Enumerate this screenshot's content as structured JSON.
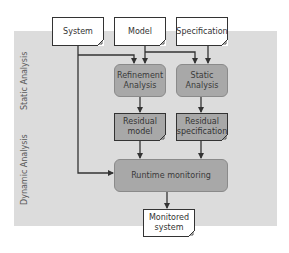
{
  "diagram": {
    "lanes": [
      {
        "label": "Static Analysis"
      },
      {
        "label": "Dynamic Analysis"
      }
    ],
    "inputs": {
      "system": "System",
      "model": "Model",
      "specification": "Specification"
    },
    "processes": {
      "refinement": {
        "line1": "Refinement",
        "line2": "Analysis"
      },
      "static": {
        "line1": "Static",
        "line2": "Analysis"
      },
      "runtime": "Runtime monitoring"
    },
    "artifacts": {
      "residual_model": {
        "line1": "Residual",
        "line2": "model"
      },
      "residual_spec": {
        "line1": "Residual",
        "line2": "specification"
      },
      "monitored": {
        "line1": "Monitored",
        "line2": "system"
      }
    },
    "colors": {
      "background_region": "#dcdcdc",
      "process_fill": "#a8a8a8",
      "document_fill": "#ffffff",
      "line": "#333333"
    },
    "edges": [
      {
        "from": "System",
        "to": "Refinement Analysis"
      },
      {
        "from": "System",
        "to": "Runtime monitoring"
      },
      {
        "from": "Model",
        "to": "Refinement Analysis"
      },
      {
        "from": "Model",
        "to": "Static Analysis"
      },
      {
        "from": "Specification",
        "to": "Static Analysis"
      },
      {
        "from": "Refinement Analysis",
        "to": "Residual model"
      },
      {
        "from": "Static Analysis",
        "to": "Residual specification"
      },
      {
        "from": "Residual model",
        "to": "Runtime monitoring"
      },
      {
        "from": "Residual specification",
        "to": "Runtime monitoring"
      },
      {
        "from": "Runtime monitoring",
        "to": "Monitored system"
      }
    ]
  }
}
